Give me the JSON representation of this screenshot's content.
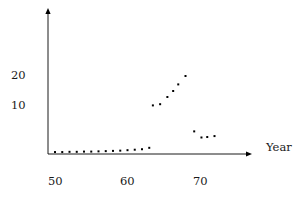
{
  "chart_data": {
    "type": "scatter",
    "title": "",
    "subtitle": "",
    "xlabel": "Year",
    "ylabel": "",
    "xlim": [
      48,
      74
    ],
    "ylim": [
      0,
      26
    ],
    "grid": false,
    "legend": null,
    "xticks": [
      50,
      60,
      70
    ],
    "xtick_labels": [
      "50",
      "60",
      "70"
    ],
    "yticks": [
      10,
      20
    ],
    "ytick_labels": [
      "10",
      "20"
    ],
    "marker": "square-dot",
    "marker_color": "#000000",
    "marker_size_px": 2,
    "axis_color": "#000000",
    "background": "#ffffff",
    "series": [
      {
        "name": "observations",
        "x": [
          50,
          51,
          52,
          53,
          54,
          55,
          56,
          57,
          58,
          59,
          60,
          61,
          62,
          63,
          63.5,
          64.5,
          65.5,
          66.3,
          67.0,
          68.0,
          69.2,
          70.2,
          71.0,
          72.0
        ],
        "y": [
          0.2,
          0.2,
          0.25,
          0.25,
          0.3,
          0.3,
          0.35,
          0.4,
          0.45,
          0.5,
          0.6,
          0.7,
          0.8,
          1.1,
          10.2,
          10.6,
          13.0,
          15.0,
          17.2,
          20.0,
          4.6,
          3.3,
          3.4,
          3.6
        ],
        "color": "#000000"
      }
    ],
    "axes_geometry": {
      "x_axis_y_px": 154,
      "y_axis_x_px": 48,
      "x_px_at_50": 55,
      "x_px_at_60": 127,
      "x_px_at_70": 200,
      "y_px_at_0": 153,
      "y_px_at_10": 106,
      "y_px_at_20": 76,
      "x_arrow_tip_px": 252,
      "y_arrow_tip_px": 8
    }
  },
  "labels": {
    "y_20": "20",
    "y_10": "10",
    "x_50": "50",
    "x_60": "60",
    "x_70": "70",
    "axis_year": "Year"
  }
}
